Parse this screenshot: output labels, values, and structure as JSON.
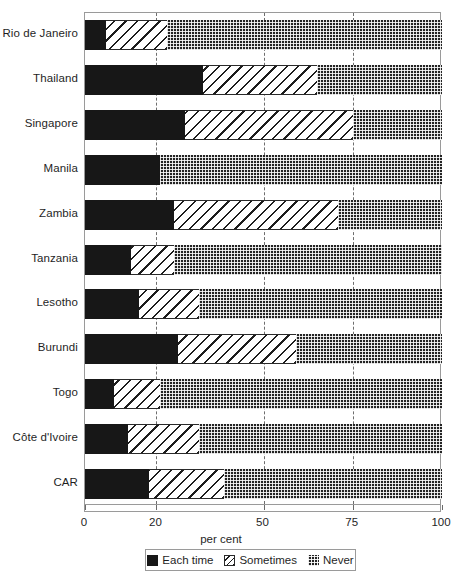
{
  "chart_data": {
    "type": "bar",
    "orientation": "horizontal",
    "stacked": true,
    "title": "",
    "xlabel": "per cent",
    "ylabel": "",
    "xlim": [
      0,
      100
    ],
    "xticks": [
      0,
      20,
      50,
      75,
      100
    ],
    "xticklabels": [
      "0",
      "20",
      "50",
      "75",
      "100"
    ],
    "gridlines": [
      20,
      50,
      75
    ],
    "grid": true,
    "legend_position": "bottom",
    "categories": [
      "Rio de Janeiro",
      "Thailand",
      "Singapore",
      "Manila",
      "Zambia",
      "Tanzania",
      "Lesotho",
      "Burundi",
      "Togo",
      "Côte d'Ivoire",
      "CAR"
    ],
    "series": [
      {
        "name": "Each time",
        "values": [
          6,
          33,
          28,
          21,
          25,
          13,
          15,
          26,
          8,
          12,
          18
        ]
      },
      {
        "name": "Sometimes",
        "values": [
          17,
          32,
          47,
          0,
          46,
          12,
          17,
          33,
          13,
          20,
          21
        ]
      },
      {
        "name": "Never",
        "values": [
          77,
          35,
          25,
          79,
          29,
          75,
          68,
          41,
          79,
          68,
          61
        ]
      }
    ],
    "units": "per cent"
  },
  "axis": {
    "x_title": "per cent",
    "tick_labels": [
      "0",
      "20",
      "50",
      "75",
      "100"
    ]
  },
  "legend": {
    "items": [
      {
        "label": "Each time",
        "pattern": "solid-black"
      },
      {
        "label": "Sometimes",
        "pattern": "diagonal-hatch"
      },
      {
        "label": "Never",
        "pattern": "dotted-dark"
      }
    ]
  },
  "colors": {
    "each_time": "#171717",
    "sometimes_fill": "#ffffff",
    "sometimes_stroke": "#1d1d1d",
    "never": "#232323",
    "frame": "#9a9a9a",
    "gridline": "#6e6e6e",
    "text": "#1f1f1f"
  }
}
